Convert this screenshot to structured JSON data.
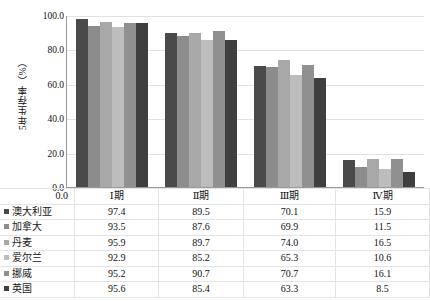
{
  "chart_data": {
    "type": "bar",
    "title": "",
    "xlabel": "",
    "ylabel": "5年生存率（%）",
    "ylim": [
      0,
      100
    ],
    "yticks": [
      "0.0",
      "20.0",
      "40.0",
      "60.0",
      "80.0",
      "100.0"
    ],
    "ytick_values": [
      0,
      20,
      40,
      60,
      80,
      100
    ],
    "grid": true,
    "legend_position": "table-below",
    "categories": [
      "Ⅰ期",
      "Ⅱ期",
      "Ⅲ期",
      "Ⅳ期"
    ],
    "series": [
      {
        "name": "澳大利亚",
        "color": "#4a4a4a",
        "values": [
          97.4,
          89.5,
          70.1,
          15.9
        ]
      },
      {
        "name": "加拿大",
        "color": "#8c8c8c",
        "values": [
          93.5,
          87.6,
          69.9,
          11.5
        ]
      },
      {
        "name": "丹麦",
        "color": "#a8a8a8",
        "values": [
          95.9,
          89.7,
          74.0,
          16.5
        ]
      },
      {
        "name": "爱尔兰",
        "color": "#bdbdbd",
        "values": [
          92.9,
          85.2,
          65.3,
          10.6
        ]
      },
      {
        "name": "挪威",
        "color": "#909090",
        "values": [
          95.2,
          90.7,
          70.7,
          16.1
        ]
      },
      {
        "name": "英国",
        "color": "#3f3f3f",
        "values": [
          95.6,
          85.4,
          63.3,
          8.5
        ]
      }
    ]
  },
  "table": {
    "corner_label": "0.0",
    "headers": [
      "Ⅰ期",
      "Ⅱ期",
      "Ⅲ期",
      "Ⅳ期"
    ],
    "rows": [
      {
        "name": "澳大利亚",
        "color": "#4a4a4a",
        "values": [
          "97.4",
          "89.5",
          "70.1",
          "15.9"
        ]
      },
      {
        "name": "加拿大",
        "color": "#8c8c8c",
        "values": [
          "93.5",
          "87.6",
          "69.9",
          "11.5"
        ]
      },
      {
        "name": "丹麦",
        "color": "#a8a8a8",
        "values": [
          "95.9",
          "89.7",
          "74.0",
          "16.5"
        ]
      },
      {
        "name": "爱尔兰",
        "color": "#bdbdbd",
        "values": [
          "92.9",
          "85.2",
          "65.3",
          "10.6"
        ]
      },
      {
        "name": "挪威",
        "color": "#909090",
        "values": [
          "95.2",
          "90.7",
          "70.7",
          "16.1"
        ]
      },
      {
        "name": "英国",
        "color": "#3f3f3f",
        "values": [
          "95.6",
          "85.4",
          "63.3",
          "8.5"
        ]
      }
    ]
  }
}
